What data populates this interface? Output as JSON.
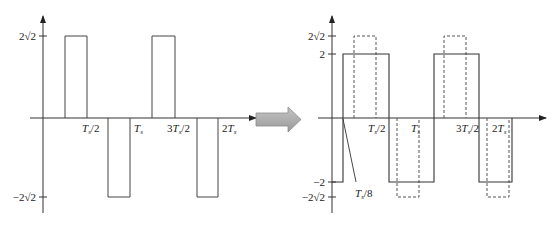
{
  "left_plot": {
    "y_ticks": [
      {
        "label": "2√2",
        "value": 2.828
      },
      {
        "label": "−2√2",
        "value": -2.828
      }
    ],
    "x_ticks": [
      {
        "base": "T",
        "sub": "s",
        "suffix": "/2",
        "prefix": ""
      },
      {
        "base": "T",
        "sub": "s",
        "suffix": "",
        "prefix": ""
      },
      {
        "base": "T",
        "sub": "s",
        "suffix": "/2",
        "prefix": "3"
      },
      {
        "base": "T",
        "sub": "s",
        "suffix": "",
        "prefix": "2"
      }
    ],
    "pulses": [
      {
        "start": "T_s/4",
        "end": "T_s/2",
        "level": "2√2"
      },
      {
        "start": "3T_s/4",
        "end": "T_s",
        "level": "-2√2"
      },
      {
        "start": "5T_s/4",
        "end": "3T_s/2",
        "level": "2√2"
      },
      {
        "start": "7T_s/4",
        "end": "2T_s",
        "level": "-2√2"
      }
    ]
  },
  "arrow": {
    "direction": "right",
    "color": "#a8a8a8"
  },
  "right_plot": {
    "y_ticks": [
      {
        "label": "2√2",
        "value": 2.828
      },
      {
        "label": "2",
        "value": 2
      },
      {
        "label": "−2",
        "value": -2
      },
      {
        "label": "−2√2",
        "value": -2.828
      }
    ],
    "x_ticks": [
      {
        "base": "T",
        "sub": "s",
        "suffix": "/2",
        "prefix": ""
      },
      {
        "base": "T",
        "sub": "s",
        "suffix": "",
        "prefix": ""
      },
      {
        "base": "T",
        "sub": "s",
        "suffix": "/2",
        "prefix": "3"
      },
      {
        "base": "T",
        "sub": "s",
        "suffix": "",
        "prefix": "2"
      }
    ],
    "annotation": {
      "base": "T",
      "sub": "s",
      "suffix": "/8"
    },
    "square_wave": {
      "amplitude": 2,
      "shift": "T_s/8",
      "style": "solid"
    },
    "reference_pulses": {
      "amplitude": "2√2",
      "style": "dashed"
    }
  }
}
